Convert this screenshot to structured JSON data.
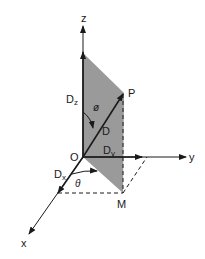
{
  "diagram": {
    "type": "3d-coordinate-vector-decomposition",
    "axes": {
      "x": {
        "label": "x"
      },
      "y": {
        "label": "y"
      },
      "z": {
        "label": "z"
      }
    },
    "points": {
      "origin": {
        "label": "O"
      },
      "tip": {
        "label": "P"
      },
      "projection": {
        "label": "M"
      }
    },
    "vector": {
      "label": "D"
    },
    "components": {
      "x": {
        "label": "D",
        "sub": "x"
      },
      "y": {
        "label": "D",
        "sub": "y"
      },
      "z": {
        "label": "D",
        "sub": "z"
      }
    },
    "angles": {
      "polar": {
        "label": "ø"
      },
      "azimuth": {
        "label": "θ"
      }
    },
    "colors": {
      "line": "#1a1a1a",
      "plane_fill": "#9a9a9a",
      "background": "#ffffff"
    }
  }
}
